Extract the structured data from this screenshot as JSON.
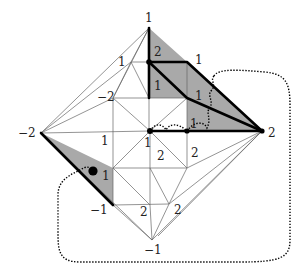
{
  "diagram": {
    "type": "triangulated-rhombus-with-paths",
    "colors": {
      "shade": "#a9a9a9",
      "thick_edge": "#000000",
      "thin_edge": "#666666",
      "background": "#ffffff"
    },
    "outer_vertices": {
      "top": {
        "label": "1"
      },
      "left": {
        "label": "−2"
      },
      "right": {
        "label": "2"
      },
      "bottom": {
        "label": "−1"
      }
    },
    "labels": {
      "top": "1",
      "left": "−2",
      "right": "2",
      "bottom": "−1",
      "upper_left_a": "1",
      "upper_left_b": "−2",
      "shaded_top_2": "2",
      "shaded_top_right_1": "1",
      "shaded_inner_1": "1",
      "shaded_mid_1": "1",
      "shaded_low_1": "1",
      "left_mid_1": "1",
      "center_1": "1",
      "center_low_2": "2",
      "right_low_2": "2",
      "left_shade_1": "1",
      "lower_left_neg1": "−1",
      "bottom_2a": "2",
      "bottom_2b": "2"
    }
  }
}
